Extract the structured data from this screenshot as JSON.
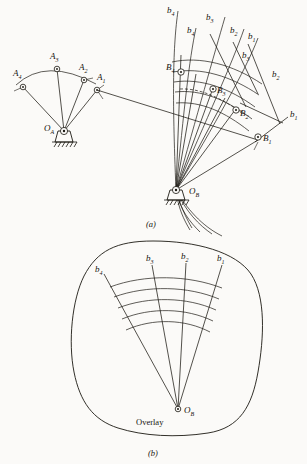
{
  "figure": {
    "title_caption_a": "(a)",
    "title_caption_b": "(b)",
    "overlay_label": "Overlay"
  },
  "diagram_a": {
    "pivot_a": {
      "label": "O",
      "sub": "A"
    },
    "pivot_b": {
      "label": "O",
      "sub": "B"
    },
    "crank_points": [
      {
        "label": "A",
        "sub": "1"
      },
      {
        "label": "A",
        "sub": "2"
      },
      {
        "label": "A",
        "sub": "3"
      },
      {
        "label": "A",
        "sub": "4"
      }
    ],
    "follower_points": [
      {
        "label": "B",
        "sub": "1"
      },
      {
        "label": "B",
        "sub": "2"
      },
      {
        "label": "B",
        "sub": "3"
      },
      {
        "label": "B",
        "sub": "4"
      }
    ],
    "curve_labels": [
      {
        "label": "b",
        "sub": "1"
      },
      {
        "label": "b",
        "sub": "2"
      },
      {
        "label": "b",
        "sub": "3"
      },
      {
        "label": "b",
        "sub": "4"
      }
    ],
    "ray_labels": [
      {
        "label": "b",
        "sub": "1"
      },
      {
        "label": "b",
        "sub": "2"
      },
      {
        "label": "b",
        "sub": "3"
      },
      {
        "label": "b",
        "sub": "4"
      }
    ]
  },
  "diagram_b": {
    "pivot_b": {
      "label": "O",
      "sub": "B"
    },
    "overlay_text": "Overlay",
    "ray_labels": [
      {
        "label": "b",
        "sub": "1"
      },
      {
        "label": "b",
        "sub": "2"
      },
      {
        "label": "b",
        "sub": "3"
      },
      {
        "label": "b",
        "sub": "4"
      }
    ],
    "arc_count": 5,
    "ray_count": 4
  },
  "colors": {
    "ink": "#1b1812",
    "paper": "#fbfaf8"
  }
}
